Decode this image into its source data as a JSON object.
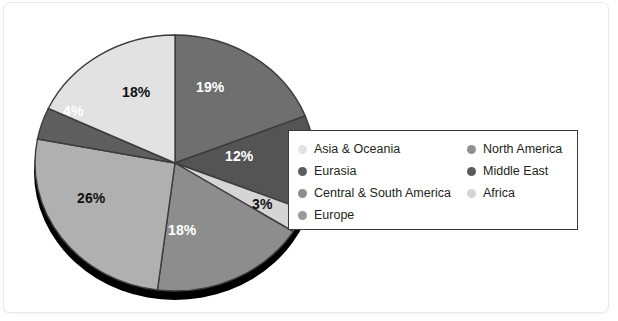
{
  "chart_data": {
    "type": "pie",
    "title": "",
    "categories": [
      "North America",
      "Middle East",
      "Africa",
      "Europe",
      "Central & South America",
      "Eurasia",
      "Asia & Oceania"
    ],
    "values": [
      19,
      12,
      3,
      18,
      26,
      4,
      18
    ],
    "value_labels": [
      "19%",
      "12%",
      "3%",
      "18%",
      "26%",
      "4%",
      "18%"
    ],
    "units": "percent",
    "legend_position": "right",
    "grid": false,
    "three_d": true,
    "start_angle_deg": 0,
    "direction": "clockwise",
    "colors": [
      "#6f6f6f",
      "#545454",
      "#d5d5d5",
      "#8d8d8d",
      "#b0b0b0",
      "#5e5e5e",
      "#e2e2e2"
    ],
    "shadow_color": "#000000",
    "slice_border_color": "#3c3c3c"
  },
  "slices": [
    {
      "name": "North America",
      "label": "19%",
      "color": "#6f6f6f",
      "label_color": "light",
      "lx": 196,
      "ly": 79
    },
    {
      "name": "Middle East",
      "label": "12%",
      "color": "#545454",
      "label_color": "light",
      "lx": 225,
      "ly": 148
    },
    {
      "name": "Africa",
      "label": "3%",
      "color": "#d5d5d5",
      "label_color": "dark",
      "lx": 252,
      "ly": 196
    },
    {
      "name": "Europe",
      "label": "18%",
      "color": "#8d8d8d",
      "label_color": "light",
      "lx": 168,
      "ly": 222
    },
    {
      "name": "Central & South America",
      "label": "26%",
      "color": "#b0b0b0",
      "label_color": "dark",
      "lx": 77,
      "ly": 190
    },
    {
      "name": "Eurasia",
      "label": "4%",
      "color": "#5e5e5e",
      "label_color": "light",
      "lx": 63,
      "ly": 103
    },
    {
      "name": "Asia & Oceania",
      "label": "18%",
      "color": "#e2e2e2",
      "label_color": "dark",
      "lx": 122,
      "ly": 84
    }
  ],
  "legend": {
    "left_column": [
      {
        "label": "Asia & Oceania",
        "color": "#e2e2e2"
      },
      {
        "label": "Eurasia",
        "color": "#5e5e5e"
      },
      {
        "label": "Central & South America",
        "color": "#8d8d8d"
      },
      {
        "label": "Europe",
        "color": "#9a9a9a"
      }
    ],
    "right_column": [
      {
        "label": "North America",
        "color": "#8f8f8f"
      },
      {
        "label": "Middle East",
        "color": "#5a5a5a"
      },
      {
        "label": "Africa",
        "color": "#d5d5d5"
      }
    ]
  }
}
